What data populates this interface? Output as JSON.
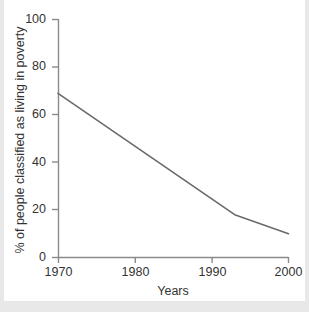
{
  "chart_data": {
    "type": "line",
    "title": "",
    "xlabel": "Years",
    "ylabel": "% of people classified as living in poverty",
    "xlim": [
      1970,
      2000
    ],
    "ylim": [
      0,
      100
    ],
    "xticks": [
      "1970",
      "1980",
      "1990",
      "2000"
    ],
    "xtick_values": [
      1970,
      1980,
      1990,
      2000
    ],
    "yticks": [
      "0",
      "20",
      "40",
      "60",
      "80",
      "100"
    ],
    "ytick_values": [
      0,
      20,
      40,
      60,
      80,
      100
    ],
    "grid": false,
    "legend": null,
    "series": [
      {
        "name": "% of people classified as living in poverty",
        "color": "#6a6a6a",
        "x": [
          1970,
          1993,
          2000
        ],
        "values": [
          69,
          18,
          10
        ]
      }
    ]
  },
  "axes": {
    "line_color": "#8a8a8a",
    "text_color": "#333333"
  },
  "page": {
    "background": "#e8e8e8",
    "card_background": "#ffffff"
  },
  "labels": {
    "y0": "0",
    "y20": "20",
    "y40": "40",
    "y60": "60",
    "y80": "80",
    "y100": "100",
    "x1970": "1970",
    "x1980": "1980",
    "x1990": "1990",
    "x2000": "2000",
    "x_title": "Years",
    "y_title": "% of people classified as living in poverty"
  }
}
